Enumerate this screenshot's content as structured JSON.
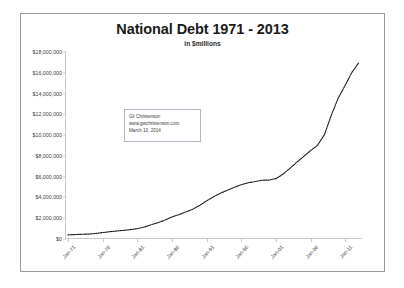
{
  "chart_data": {
    "type": "line",
    "title": "National Debt 1971 - 2013",
    "subtitle": "in $millions",
    "xlabel": "",
    "ylabel": "",
    "ylim": [
      0,
      18000000
    ],
    "ytick_labels": [
      "$18,000,000",
      "$16,000,000",
      "$14,000,000",
      "$12,000,000",
      "$10,000,000",
      "$8,000,000",
      "$6,000,000",
      "$4,000,000",
      "$2,000,000",
      "$0"
    ],
    "ytick_values": [
      18000000,
      16000000,
      14000000,
      12000000,
      10000000,
      8000000,
      6000000,
      4000000,
      2000000,
      0
    ],
    "xtick_labels": [
      "Jan-71",
      "Jan-76",
      "Jan-81",
      "Jan-86",
      "Jan-91",
      "Jan-96",
      "Jan-01",
      "Jan-06",
      "Jan-11"
    ],
    "grid": false,
    "legend": "none",
    "line_style": "dotted",
    "line_color": "#1a1a1a",
    "x": [
      1971,
      1972,
      1973,
      1974,
      1975,
      1976,
      1977,
      1978,
      1979,
      1980,
      1981,
      1982,
      1983,
      1984,
      1985,
      1986,
      1987,
      1988,
      1989,
      1990,
      1991,
      1992,
      1993,
      1994,
      1995,
      1996,
      1997,
      1998,
      1999,
      2000,
      2001,
      2002,
      2003,
      2004,
      2005,
      2006,
      2007,
      2008,
      2009,
      2010,
      2011,
      2012,
      2013
    ],
    "values": [
      398000,
      427000,
      458000,
      475000,
      533000,
      620000,
      699000,
      772000,
      827000,
      908000,
      998000,
      1142000,
      1377000,
      1572000,
      1823000,
      2125000,
      2350000,
      2602000,
      2857000,
      3233000,
      3665000,
      4065000,
      4411000,
      4693000,
      4974000,
      5225000,
      5413000,
      5526000,
      5656000,
      5674000,
      5807000,
      6228000,
      6783000,
      7379000,
      7933000,
      8507000,
      9008000,
      10025000,
      11910000,
      13562000,
      14790000,
      16066000,
      17000000
    ],
    "annotation_box": {
      "line1": "Gil Christenson",
      "line2": "www.gwchristenson.com",
      "line3": "March 10, 2014"
    }
  }
}
